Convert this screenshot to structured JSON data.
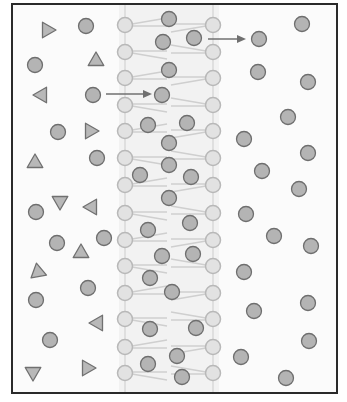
{
  "diagram": {
    "title": "",
    "frame": {
      "x": 12,
      "y": 4,
      "width": 325,
      "height": 389
    },
    "colors": {
      "frame": "#2a2a2a",
      "head_fill": "#e2e2e2",
      "head_stroke": "#b8b8b8",
      "tail": "#cfcfcf",
      "particle_fill": "#b4b4b4",
      "particle_stroke": "#6e6e6e",
      "triangle_fill": "#b8b8b8",
      "triangle_stroke": "#707070",
      "arrow": "#707070",
      "background": "#f7f7f7"
    },
    "membrane": {
      "left_x": 125,
      "right_x": 213,
      "head_radius": 7.5,
      "head_y": [
        25,
        52,
        78,
        105,
        131,
        158,
        185,
        213,
        240,
        266,
        293,
        319,
        347,
        373
      ]
    },
    "particles_circles": [
      {
        "x": 86,
        "y": 26
      },
      {
        "x": 35,
        "y": 65
      },
      {
        "x": 93,
        "y": 95
      },
      {
        "x": 58,
        "y": 132
      },
      {
        "x": 97,
        "y": 158
      },
      {
        "x": 36,
        "y": 212
      },
      {
        "x": 57,
        "y": 243
      },
      {
        "x": 104,
        "y": 238
      },
      {
        "x": 88,
        "y": 288
      },
      {
        "x": 36,
        "y": 300
      },
      {
        "x": 50,
        "y": 340
      },
      {
        "x": 169,
        "y": 19
      },
      {
        "x": 163,
        "y": 42
      },
      {
        "x": 194,
        "y": 38
      },
      {
        "x": 169,
        "y": 70
      },
      {
        "x": 162,
        "y": 95
      },
      {
        "x": 148,
        "y": 125
      },
      {
        "x": 187,
        "y": 123
      },
      {
        "x": 169,
        "y": 143
      },
      {
        "x": 169,
        "y": 165
      },
      {
        "x": 140,
        "y": 175
      },
      {
        "x": 191,
        "y": 177
      },
      {
        "x": 169,
        "y": 198
      },
      {
        "x": 148,
        "y": 230
      },
      {
        "x": 190,
        "y": 223
      },
      {
        "x": 162,
        "y": 256
      },
      {
        "x": 193,
        "y": 254
      },
      {
        "x": 150,
        "y": 278
      },
      {
        "x": 172,
        "y": 292
      },
      {
        "x": 150,
        "y": 329
      },
      {
        "x": 196,
        "y": 328
      },
      {
        "x": 177,
        "y": 356
      },
      {
        "x": 148,
        "y": 364
      },
      {
        "x": 182,
        "y": 377
      },
      {
        "x": 302,
        "y": 24
      },
      {
        "x": 259,
        "y": 39
      },
      {
        "x": 258,
        "y": 72
      },
      {
        "x": 308,
        "y": 82
      },
      {
        "x": 288,
        "y": 117
      },
      {
        "x": 244,
        "y": 139
      },
      {
        "x": 308,
        "y": 153
      },
      {
        "x": 262,
        "y": 171
      },
      {
        "x": 299,
        "y": 189
      },
      {
        "x": 246,
        "y": 214
      },
      {
        "x": 274,
        "y": 236
      },
      {
        "x": 311,
        "y": 246
      },
      {
        "x": 244,
        "y": 272
      },
      {
        "x": 254,
        "y": 311
      },
      {
        "x": 308,
        "y": 303
      },
      {
        "x": 309,
        "y": 341
      },
      {
        "x": 241,
        "y": 357
      },
      {
        "x": 286,
        "y": 378
      }
    ],
    "particles_triangles": [
      {
        "x": 47,
        "y": 30,
        "dir": "up-left"
      },
      {
        "x": 96,
        "y": 61,
        "dir": "up"
      },
      {
        "x": 42,
        "y": 95,
        "dir": "left"
      },
      {
        "x": 90,
        "y": 131,
        "dir": "right"
      },
      {
        "x": 35,
        "y": 163,
        "dir": "up"
      },
      {
        "x": 60,
        "y": 201,
        "dir": "down"
      },
      {
        "x": 92,
        "y": 207,
        "dir": "left"
      },
      {
        "x": 81,
        "y": 253,
        "dir": "up"
      },
      {
        "x": 38,
        "y": 272,
        "dir": "down-left"
      },
      {
        "x": 98,
        "y": 323,
        "dir": "left"
      },
      {
        "x": 33,
        "y": 372,
        "dir": "down"
      },
      {
        "x": 87,
        "y": 368,
        "dir": "right"
      }
    ],
    "arrows": [
      {
        "x1": 106,
        "y1": 94,
        "x2": 152,
        "y2": 94
      },
      {
        "x1": 208,
        "y1": 39,
        "x2": 246,
        "y2": 39
      }
    ]
  }
}
